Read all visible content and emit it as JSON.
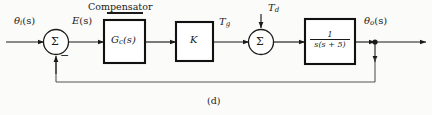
{
  "figure": {
    "caption": "(d)",
    "section_title": "Compensator",
    "type": "control-system-block-diagram"
  },
  "signals": {
    "input": {
      "base": "θ",
      "sub": "i",
      "arg": "(s)",
      "full": "θi(s)"
    },
    "error": {
      "base": "E",
      "sub": "",
      "arg": "(s)",
      "full": "E(s)"
    },
    "torque_generated": {
      "base": "T",
      "sub": "g",
      "arg": "",
      "full": "Tg"
    },
    "disturbance": {
      "base": "T",
      "sub": "d",
      "arg": "",
      "full": "Td"
    },
    "output": {
      "base": "θ",
      "sub": "o",
      "arg": "(s)",
      "full": "θo(s)"
    }
  },
  "summing_junctions": [
    {
      "name": "input-summer",
      "glyph": "Σ",
      "signs": [
        "+",
        "-"
      ],
      "feedback_sign": "−"
    },
    {
      "name": "disturbance-summer",
      "glyph": "Σ",
      "signs": [
        "+",
        "+"
      ]
    }
  ],
  "blocks": [
    {
      "name": "compensator",
      "label_base": "G",
      "label_sub": "c",
      "label_arg": "(s)",
      "label": "Gc(s)"
    },
    {
      "name": "gain",
      "label_base": "K",
      "label_sub": "",
      "label_arg": "",
      "label": "K"
    },
    {
      "name": "plant",
      "numerator": "1",
      "denominator": "s(s + 5)",
      "label": "1 / s(s + 5)"
    }
  ],
  "feedback": {
    "name": "unity-feedback-path",
    "gain": "1",
    "sign": "−"
  },
  "colors": {
    "line": "#1a1a1a",
    "block_border": "#111111",
    "background": "#fbfbfa",
    "feedback_line": "#555555",
    "text": "#1a1a1a"
  }
}
